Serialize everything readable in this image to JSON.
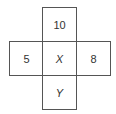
{
  "diagram": {
    "type": "cross-grid",
    "cells": {
      "top": "10",
      "left": "5",
      "center": "X",
      "right": "8",
      "bottom": "Y"
    }
  }
}
